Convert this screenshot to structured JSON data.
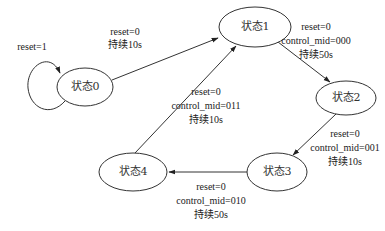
{
  "diagram": {
    "type": "state-machine",
    "states": [
      {
        "id": "s0",
        "label": "状态0"
      },
      {
        "id": "s1",
        "label": "状态1"
      },
      {
        "id": "s2",
        "label": "状态2"
      },
      {
        "id": "s3",
        "label": "状态3"
      },
      {
        "id": "s4",
        "label": "状态4"
      }
    ],
    "transitions": [
      {
        "from": "状态0",
        "to": "状态0",
        "lines": [
          "reset=1"
        ]
      },
      {
        "from": "状态0",
        "to": "状态1",
        "lines": [
          "reset=0",
          "持续10s"
        ]
      },
      {
        "from": "状态1",
        "to": "状态2",
        "lines": [
          "reset=0",
          "control_mid=000",
          "持续50s"
        ]
      },
      {
        "from": "状态2",
        "to": "状态3",
        "lines": [
          "reset=0",
          "control_mid=001",
          "持续10s"
        ]
      },
      {
        "from": "状态3",
        "to": "状态4",
        "lines": [
          "reset=0",
          "control_mid=010",
          "持续50s"
        ]
      },
      {
        "from": "状态4",
        "to": "状态1",
        "lines": [
          "reset=0",
          "control_mid=011",
          "持续10s"
        ]
      }
    ]
  }
}
